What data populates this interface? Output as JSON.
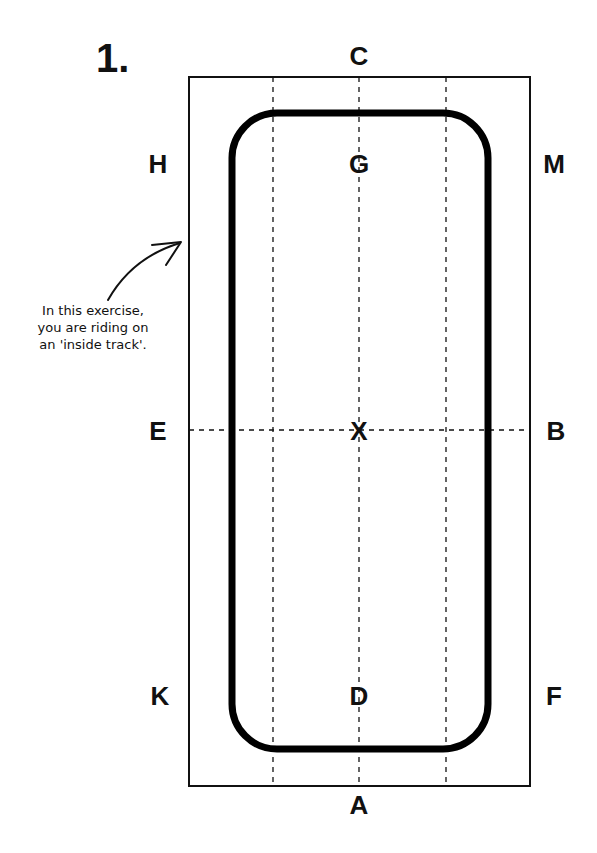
{
  "figure": {
    "number": "1.",
    "annotation": {
      "line1": "In this exercise,",
      "line2": "you are riding on",
      "line3": "an 'inside track'."
    },
    "markers": {
      "C": "C",
      "A": "A",
      "H": "H",
      "M": "M",
      "E": "E",
      "B": "B",
      "K": "K",
      "F": "F",
      "G": "G",
      "X": "X",
      "D": "D"
    },
    "colors": {
      "line": "#111111",
      "background": "#ffffff"
    }
  }
}
